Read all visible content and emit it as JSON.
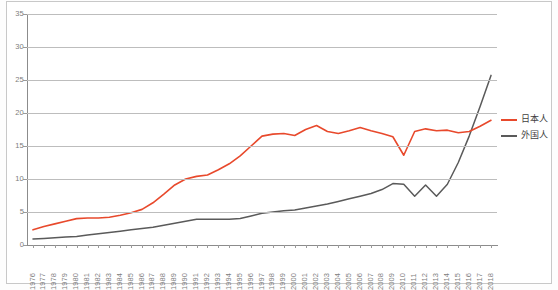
{
  "chart_data": {
    "type": "line",
    "title": "",
    "xlabel": "",
    "ylabel": "",
    "ylim": [
      0,
      35
    ],
    "yticks": [
      0,
      5,
      10,
      15,
      20,
      25,
      30,
      35
    ],
    "grid": true,
    "legend_position": "right",
    "x": [
      1976,
      1977,
      1978,
      1979,
      1980,
      1981,
      1982,
      1983,
      1984,
      1985,
      1986,
      1987,
      1988,
      1989,
      1990,
      1991,
      1992,
      1993,
      1994,
      1995,
      1996,
      1997,
      1998,
      1999,
      2000,
      2001,
      2002,
      2003,
      2004,
      2005,
      2006,
      2007,
      2008,
      2009,
      2010,
      2011,
      2012,
      2013,
      2014,
      2015,
      2016,
      2017,
      2018
    ],
    "categories": [
      "1976",
      "1977",
      "1978",
      "1979",
      "1980",
      "1981",
      "1982",
      "1983",
      "1984",
      "1985",
      "1986",
      "1987",
      "1988",
      "1989",
      "1990",
      "1991",
      "1992",
      "1993",
      "1994",
      "1995",
      "1996",
      "1997",
      "1998",
      "1999",
      "2000",
      "2001",
      "2002",
      "2003",
      "2004",
      "2005",
      "2006",
      "2007",
      "2008",
      "2009",
      "2010",
      "2011",
      "2012",
      "2013",
      "2014",
      "2015",
      "2016",
      "2017",
      "2018"
    ],
    "series": [
      {
        "name": "日本人",
        "color": "#E8492C",
        "values": [
          2.3,
          2.8,
          3.2,
          3.6,
          4.0,
          4.1,
          4.1,
          4.2,
          4.5,
          4.9,
          5.4,
          6.4,
          7.7,
          9.1,
          10.0,
          10.4,
          10.6,
          11.4,
          12.3,
          13.5,
          15.0,
          16.5,
          16.8,
          16.9,
          16.6,
          17.5,
          18.1,
          17.2,
          16.9,
          17.3,
          17.8,
          17.3,
          16.9,
          16.4,
          13.6,
          17.2,
          17.6,
          17.3,
          17.4,
          17.0,
          17.2,
          18.0,
          18.9
        ]
      },
      {
        "name": "外国人",
        "color": "#5A5A5A",
        "values": [
          0.9,
          1.0,
          1.1,
          1.2,
          1.3,
          1.5,
          1.7,
          1.9,
          2.1,
          2.3,
          2.5,
          2.7,
          3.0,
          3.3,
          3.6,
          3.9,
          3.9,
          3.9,
          3.9,
          4.0,
          4.4,
          4.8,
          5.0,
          5.2,
          5.3,
          5.6,
          5.9,
          6.2,
          6.6,
          7.0,
          7.4,
          7.8,
          8.4,
          9.3,
          9.2,
          7.4,
          9.1,
          7.4,
          9.2,
          12.5,
          16.5,
          21.0,
          25.7
        ]
      }
    ]
  },
  "yaxis": {
    "ticks": [
      "0",
      "5",
      "10",
      "15",
      "20",
      "25",
      "30",
      "35"
    ]
  },
  "xaxis": {
    "ticks": [
      "1976",
      "1977",
      "1978",
      "1979",
      "1980",
      "1981",
      "1982",
      "1983",
      "1984",
      "1985",
      "1986",
      "1987",
      "1988",
      "1989",
      "1990",
      "1991",
      "1992",
      "1993",
      "1994",
      "1995",
      "1996",
      "1997",
      "1998",
      "1999",
      "2000",
      "2001",
      "2002",
      "2003",
      "2004",
      "2005",
      "2006",
      "2007",
      "2008",
      "2009",
      "2010",
      "2011",
      "2012",
      "2013",
      "2014",
      "2015",
      "2016",
      "2017",
      "2018"
    ]
  },
  "legend": {
    "items": [
      {
        "label": "日本人",
        "color": "#E8492C"
      },
      {
        "label": "外国人",
        "color": "#5A5A5A"
      }
    ]
  },
  "colors": {
    "series_japanese": "#E8492C",
    "series_foreign": "#5A5A5A",
    "gridline": "#BDBDBD",
    "axis": "#8C8C8C",
    "tick_text": "#7D7D7D",
    "frame": "#C8C8C8",
    "background": "#FFFFFF"
  }
}
